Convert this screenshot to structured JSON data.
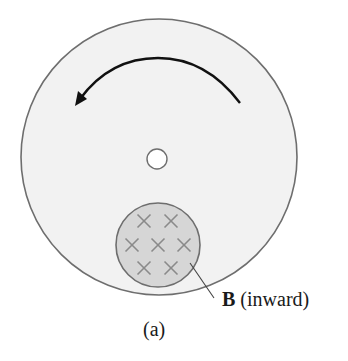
{
  "figure": {
    "caption": "(a)",
    "label": {
      "symbol": "B",
      "description": " (inward)"
    },
    "disk": {
      "cx": 159,
      "cy": 157,
      "r": 138,
      "fill": "#f2f2f2",
      "stroke": "#6e6e6e"
    },
    "hole": {
      "cx": 157,
      "cy": 159,
      "r": 10,
      "fill": "#ffffff",
      "stroke": "#6e6e6e"
    },
    "field_region": {
      "cx": 158,
      "cy": 245,
      "r": 42,
      "fill": "#d6d6d6",
      "stroke": "#6e6e6e"
    },
    "field_markers": [
      {
        "x": 144,
        "y": 221
      },
      {
        "x": 171,
        "y": 221
      },
      {
        "x": 132,
        "y": 245
      },
      {
        "x": 158,
        "y": 245
      },
      {
        "x": 184,
        "y": 245
      },
      {
        "x": 144,
        "y": 268
      },
      {
        "x": 171,
        "y": 268
      }
    ],
    "rotation_arrow": {
      "direction": "counterclockwise",
      "color": "#111111"
    },
    "colors": {
      "marker": "#8a8a8a",
      "text": "#1a1a1a"
    }
  }
}
